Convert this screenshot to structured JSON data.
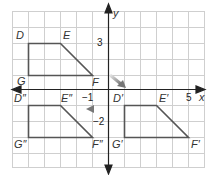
{
  "diagram": {
    "axes": {
      "x_label": "x",
      "y_label": "y",
      "x_tick_labels": [
        {
          "value": -1,
          "text": "−1"
        },
        {
          "value": 5,
          "text": "5"
        }
      ],
      "y_tick_labels": [
        {
          "value": 3,
          "text": "3"
        },
        {
          "value": -2,
          "text": "−2"
        }
      ],
      "x_range": [
        -6,
        6
      ],
      "y_range": [
        -5,
        5
      ]
    },
    "grid": {
      "on": true,
      "color": "#cccccc"
    },
    "colors": {
      "shape": "#555555",
      "arrow": "#888888",
      "axis": "#222222"
    },
    "figures": [
      {
        "name": "DEFG",
        "vertices": [
          {
            "label": "D",
            "x": -5,
            "y": 3
          },
          {
            "label": "E",
            "x": -3,
            "y": 3
          },
          {
            "label": "F",
            "x": -1,
            "y": 1
          },
          {
            "label": "G",
            "x": -5,
            "y": 1
          }
        ]
      },
      {
        "name": "D'E'F'G'",
        "vertices": [
          {
            "label": "D′",
            "x": 1,
            "y": -1
          },
          {
            "label": "E′",
            "x": 3,
            "y": -1
          },
          {
            "label": "F′",
            "x": 5,
            "y": -3
          },
          {
            "label": "G′",
            "x": 1,
            "y": -3
          }
        ]
      },
      {
        "name": "D''E''F''G''",
        "vertices": [
          {
            "label": "D″",
            "x": -5,
            "y": -1
          },
          {
            "label": "E″",
            "x": -3,
            "y": -1
          },
          {
            "label": "F″",
            "x": -1,
            "y": -3
          },
          {
            "label": "G″",
            "x": -5,
            "y": -3
          }
        ]
      }
    ],
    "arrows": [
      {
        "name": "translation-arrow",
        "from": "F",
        "to": "D′"
      },
      {
        "name": "reflection-arrow",
        "from": "D′ side",
        "to": "E″ side"
      }
    ]
  }
}
